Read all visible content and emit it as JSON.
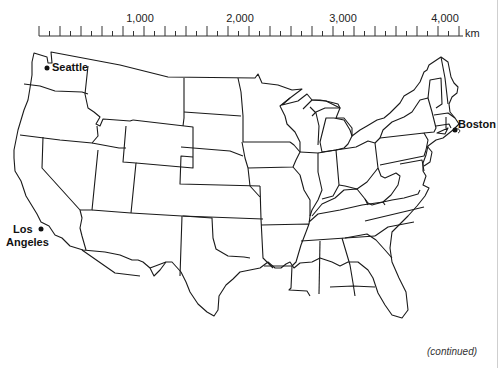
{
  "map": {
    "type": "outline map",
    "region": "Contiguous United States",
    "scale_bar": {
      "unit": "km",
      "labels": [
        "1,000",
        "2,000",
        "3,000",
        "4,000"
      ],
      "label_positions_px": [
        140,
        240,
        343,
        445
      ]
    },
    "cities": [
      {
        "name": "Seattle",
        "label": "Seattle"
      },
      {
        "name": "Los Angeles",
        "label_line1": "Los",
        "label_line2": "Angeles"
      },
      {
        "name": "Boston",
        "label": "Boston"
      }
    ],
    "footer_note": "(continued)"
  }
}
